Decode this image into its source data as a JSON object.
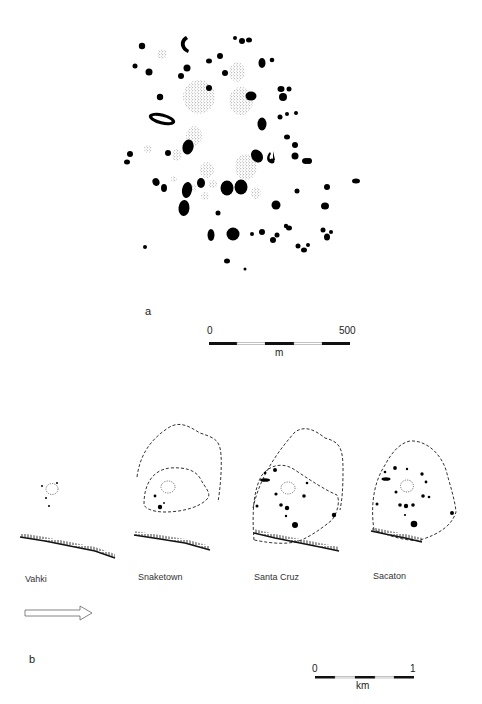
{
  "figure": {
    "panel_a": {
      "letter": "a",
      "scale": {
        "start": "0",
        "end": "500",
        "unit": "m"
      },
      "features": {
        "solid": [
          [
            142,
            46,
            3.2,
            3.2,
            0
          ],
          [
            242,
            41,
            3,
            3,
            0
          ],
          [
            235,
            38,
            2,
            2,
            0
          ],
          [
            249,
            40,
            3,
            2.5,
            0
          ],
          [
            135,
            66,
            2.5,
            2.5,
            0
          ],
          [
            149,
            72,
            3.5,
            3.5,
            0
          ],
          [
            187,
            68,
            3.5,
            3.5,
            0
          ],
          [
            181,
            76,
            3,
            3,
            0
          ],
          [
            262,
            63,
            3.5,
            5,
            0
          ],
          [
            272,
            60,
            2.3,
            2.3,
            0
          ],
          [
            160,
            97,
            3.2,
            3.2,
            0
          ],
          [
            209,
            61,
            3,
            2.5,
            0
          ],
          [
            220,
            56,
            3,
            3,
            0
          ],
          [
            225,
            73,
            3,
            3,
            0
          ],
          [
            251,
            96,
            5.5,
            4.5,
            0
          ],
          [
            209,
            88,
            3,
            3,
            0
          ],
          [
            281,
            89,
            3.5,
            3,
            0
          ],
          [
            289,
            89,
            2.5,
            2.5,
            0
          ],
          [
            283,
            97,
            4,
            4,
            0
          ],
          [
            287,
            114,
            2,
            2,
            0
          ],
          [
            280,
            117,
            2.5,
            2.5,
            0
          ],
          [
            296,
            113,
            2,
            2,
            0
          ],
          [
            262,
            124,
            4.5,
            6.5,
            0
          ],
          [
            287,
            137,
            3,
            2.5,
            0
          ],
          [
            295,
            145,
            3,
            3,
            0
          ],
          [
            295,
            156,
            3.5,
            3.5,
            0
          ],
          [
            306,
            161,
            4,
            3,
            0
          ],
          [
            257,
            156,
            5.5,
            7,
            -35
          ],
          [
            130,
            154,
            3,
            3,
            0
          ],
          [
            127,
            162,
            3,
            2.5,
            0
          ],
          [
            168,
            153,
            3,
            3,
            0
          ],
          [
            188,
            147,
            5.5,
            7.5,
            15
          ],
          [
            156,
            182,
            3.5,
            4,
            -20
          ],
          [
            164,
            188,
            3,
            4,
            0
          ],
          [
            187,
            190,
            5,
            8,
            10
          ],
          [
            201,
            183,
            4,
            5,
            0
          ],
          [
            184,
            208,
            5.5,
            8,
            5
          ],
          [
            227,
            188,
            6.5,
            7.5,
            0
          ],
          [
            241,
            187,
            6.5,
            7.5,
            0
          ],
          [
            272,
            161,
            2.5,
            2.5,
            0
          ],
          [
            276,
            205,
            4.5,
            4.5,
            0
          ],
          [
            309,
            161,
            3,
            3,
            0
          ],
          [
            277,
            235,
            2.5,
            2.5,
            0
          ],
          [
            325,
            206,
            4,
            3.5,
            0
          ],
          [
            356,
            181,
            4,
            2.5,
            0
          ],
          [
            297,
            191,
            2.5,
            2.5,
            0
          ],
          [
            289,
            228,
            3,
            2.5,
            0
          ],
          [
            211,
            235,
            3.5,
            6,
            0
          ],
          [
            233,
            234,
            6.5,
            6.5,
            0
          ],
          [
            252,
            234,
            2,
            2,
            0
          ],
          [
            262,
            232,
            3,
            3,
            0
          ],
          [
            286,
            226,
            2.2,
            2.2,
            0
          ],
          [
            227,
            261,
            3,
            2.5,
            0
          ],
          [
            245,
            269,
            1.5,
            1.5,
            0
          ],
          [
            145,
            247,
            2,
            2,
            0
          ],
          [
            273,
            240,
            3,
            3,
            0
          ],
          [
            298,
            246,
            2.5,
            2.5,
            0
          ],
          [
            304,
            250,
            3,
            2.5,
            0
          ],
          [
            327,
            237,
            3,
            3.5,
            0
          ],
          [
            331,
            232,
            2,
            2,
            0
          ],
          [
            308,
            245,
            2,
            2,
            0
          ],
          [
            323,
            230,
            2.5,
            2.5,
            0
          ],
          [
            327,
            187,
            3,
            3,
            0
          ],
          [
            218,
            213,
            2.5,
            2.5,
            0
          ]
        ],
        "stippled": [
          [
            162,
            54,
            5,
            5
          ],
          [
            199,
            97,
            16,
            17
          ],
          [
            237,
            72,
            8,
            10
          ],
          [
            241,
            101,
            12,
            14
          ],
          [
            194,
            136,
            8,
            10
          ],
          [
            177,
            155,
            5,
            6
          ],
          [
            148,
            149,
            4,
            4
          ],
          [
            207,
            170,
            7,
            8
          ],
          [
            246,
            167,
            11,
            13
          ],
          [
            192,
            188,
            4,
            4
          ],
          [
            213,
            184,
            4,
            4
          ],
          [
            256,
            193,
            5,
            6
          ],
          [
            205,
            196,
            4,
            4
          ],
          [
            174,
            179,
            3,
            3
          ]
        ],
        "arcs": [
          {
            "type": "crescent",
            "cx": 186,
            "cy": 44,
            "rx": 4,
            "ry": 8
          },
          {
            "type": "ring",
            "cx": 162,
            "cy": 119,
            "rx": 14,
            "ry": 5.5,
            "rotate": 14
          },
          {
            "type": "hook",
            "cx": 271,
            "cy": 157,
            "rx": 3,
            "ry": 4.5
          }
        ]
      }
    },
    "panel_b": {
      "letter": "b",
      "scale": {
        "start": "0",
        "end": "1",
        "unit": "km"
      },
      "sites": [
        {
          "name": "Vahki",
          "label_x": 25,
          "label_y": 578
        },
        {
          "name": "Snaketown",
          "label_x": 138,
          "label_y": 576
        },
        {
          "name": "Santa Cruz",
          "label_x": 254,
          "label_y": 576
        },
        {
          "name": "Sacaton",
          "label_x": 373,
          "label_y": 575
        }
      ],
      "arrow": "flow-direction-arrow"
    }
  }
}
